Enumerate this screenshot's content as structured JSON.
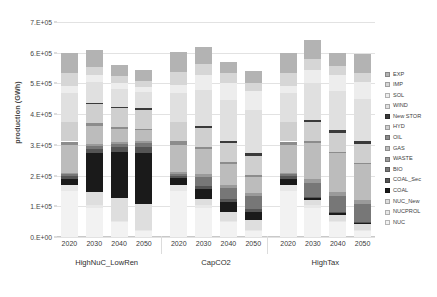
{
  "chart_data": {
    "type": "bar",
    "title": "",
    "xlabel": "",
    "ylabel": "production (GWh)",
    "ylim": [
      0,
      700000
    ],
    "ytick_labels": [
      "0.E+00",
      "1.E+05",
      "2.E+05",
      "3.E+05",
      "4.E+05",
      "5.E+05",
      "6.E+05",
      "7.E+05"
    ],
    "ytick_values": [
      0,
      100000,
      200000,
      300000,
      400000,
      500000,
      600000,
      700000
    ],
    "grid": true,
    "stacked": true,
    "legend_position": "right",
    "groups": [
      {
        "name": "HighNuC_LowRen",
        "categories": [
          "2020",
          "2030",
          "2040",
          "2050"
        ]
      },
      {
        "name": "CapCO2",
        "categories": [
          "2020",
          "2030",
          "2040",
          "2050"
        ]
      },
      {
        "name": "HighTax",
        "categories": [
          "2020",
          "2030",
          "2040",
          "2050"
        ]
      }
    ],
    "categories": [
      "2020",
      "2030",
      "2040",
      "2050",
      "2020",
      "2030",
      "2040",
      "2050",
      "2020",
      "2030",
      "2040",
      "2050"
    ],
    "series": [
      {
        "name": "NUC",
        "color": "#f2f2f2",
        "values": [
          150000,
          95000,
          48000,
          20000,
          150000,
          95000,
          48000,
          20000,
          150000,
          95000,
          48000,
          20000
        ]
      },
      {
        "name": "NUCPROL",
        "color": "#e8e8e8",
        "values": [
          20000,
          10000,
          5000,
          2000,
          20000,
          10000,
          5000,
          2000,
          20000,
          10000,
          5000,
          2000
        ]
      },
      {
        "name": "NUC_New",
        "color": "#dedede",
        "values": [
          0,
          40000,
          75000,
          85000,
          0,
          20000,
          30000,
          32000,
          0,
          15000,
          20000,
          22000
        ]
      },
      {
        "name": "COAL",
        "color": "#1a1a1a",
        "values": [
          20000,
          128000,
          148000,
          168000,
          22000,
          32000,
          30000,
          28000,
          20000,
          6000,
          5000,
          4000
        ]
      },
      {
        "name": "COAL_Sec",
        "color": "#555555",
        "values": [
          8000,
          14000,
          16000,
          18000,
          8000,
          10000,
          10000,
          9000,
          8000,
          4000,
          3000,
          2000
        ]
      },
      {
        "name": "BIO",
        "color": "#777777",
        "values": [
          6000,
          10000,
          12000,
          14000,
          6000,
          30000,
          38000,
          42000,
          6000,
          46000,
          52000,
          56000
        ]
      },
      {
        "name": "WASTE",
        "color": "#9a9a9a",
        "values": [
          5000,
          6000,
          6000,
          6000,
          5000,
          8000,
          9000,
          9000,
          5000,
          12000,
          14000,
          14000
        ]
      },
      {
        "name": "GAS",
        "color": "#bcbcbc",
        "values": [
          90000,
          60000,
          42000,
          35000,
          90000,
          80000,
          68000,
          55000,
          90000,
          118000,
          126000,
          118000
        ]
      },
      {
        "name": "OIL",
        "color": "#8c8c8c",
        "values": [
          12000,
          8000,
          6000,
          5000,
          12000,
          8000,
          6000,
          5000,
          12000,
          6000,
          5000,
          4000
        ]
      },
      {
        "name": "HYD",
        "color": "#cfcfcf",
        "values": [
          62000,
          62000,
          62000,
          62000,
          62000,
          62000,
          62000,
          62000,
          62000,
          62000,
          62000,
          62000
        ]
      },
      {
        "name": "New STOR",
        "color": "#3a3a3a",
        "values": [
          0,
          2000,
          3000,
          4000,
          0,
          5000,
          7000,
          8000,
          0,
          6000,
          8000,
          9000
        ]
      },
      {
        "name": "WIND",
        "color": "#e0e0e0",
        "values": [
          95000,
          70000,
          60000,
          52000,
          95000,
          120000,
          132000,
          140000,
          95000,
          120000,
          128000,
          135000
        ]
      },
      {
        "name": "SOL",
        "color": "#ededed",
        "values": [
          25000,
          22000,
          20000,
          18000,
          25000,
          48000,
          58000,
          64000,
          25000,
          45000,
          52000,
          58000
        ]
      },
      {
        "name": "IMP",
        "color": "#d6d6d6",
        "values": [
          42000,
          28000,
          22000,
          18000,
          42000,
          36000,
          30000,
          26000,
          42000,
          34000,
          30000,
          28000
        ]
      },
      {
        "name": "EXP",
        "color": "#b3b3b3",
        "values": [
          65000,
          55000,
          35000,
          38000,
          65000,
          56000,
          37000,
          38000,
          65000,
          61000,
          42000,
          62000
        ]
      }
    ],
    "legend_entries": [
      {
        "label": "EXP",
        "color": "#b3b3b3"
      },
      {
        "label": "IMP",
        "color": "#d6d6d6"
      },
      {
        "label": "SOL",
        "color": "#ededed"
      },
      {
        "label": "WIND",
        "color": "#e0e0e0"
      },
      {
        "label": "New STOR",
        "color": "#3a3a3a"
      },
      {
        "label": "HYD",
        "color": "#cfcfcf"
      },
      {
        "label": "OIL",
        "color": "#8c8c8c"
      },
      {
        "label": "GAS",
        "color": "#bcbcbc"
      },
      {
        "label": "WASTE",
        "color": "#9a9a9a"
      },
      {
        "label": "BIO",
        "color": "#777777"
      },
      {
        "label": "COAL_Sec",
        "color": "#555555"
      },
      {
        "label": "COAL",
        "color": "#1a1a1a"
      },
      {
        "label": "NUC_New",
        "color": "#dedede"
      },
      {
        "label": "NUCPROL",
        "color": "#e8e8e8"
      },
      {
        "label": "NUC",
        "color": "#f2f2f2"
      }
    ]
  }
}
